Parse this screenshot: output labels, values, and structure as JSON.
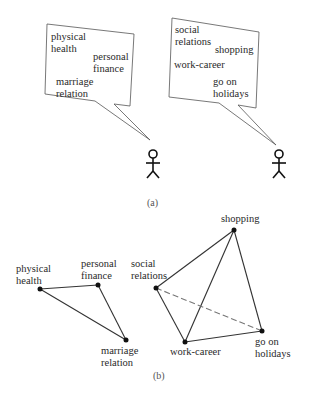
{
  "panel_a": {
    "caption": "(a)",
    "person_left": {
      "bubble_items": [
        {
          "line1": "physical",
          "line2": "health"
        },
        {
          "line1": "personal",
          "line2": "finance"
        },
        {
          "line1": "marriage",
          "line2": "relation"
        }
      ]
    },
    "person_right": {
      "bubble_items": [
        {
          "line1": "social",
          "line2": "relations"
        },
        {
          "line1": "shopping",
          "line2": ""
        },
        {
          "line1": "work-career",
          "line2": ""
        },
        {
          "line1": "go on",
          "line2": "holidays"
        }
      ]
    }
  },
  "panel_b": {
    "caption": "(b)",
    "graph_left": {
      "nodes": [
        {
          "id": "physical-health",
          "line1": "physical",
          "line2": "health"
        },
        {
          "id": "personal-finance",
          "line1": "personal",
          "line2": "finance"
        },
        {
          "id": "marriage-relation",
          "line1": "marriage",
          "line2": "relation"
        }
      ],
      "edges": [
        {
          "from": "physical-health",
          "to": "personal-finance",
          "style": "solid"
        },
        {
          "from": "personal-finance",
          "to": "marriage-relation",
          "style": "solid"
        },
        {
          "from": "physical-health",
          "to": "marriage-relation",
          "style": "solid"
        }
      ]
    },
    "graph_right": {
      "nodes": [
        {
          "id": "social-relations",
          "line1": "social",
          "line2": "relations"
        },
        {
          "id": "shopping",
          "line1": "shopping",
          "line2": ""
        },
        {
          "id": "work-career",
          "line1": "work-career",
          "line2": ""
        },
        {
          "id": "go-on-holidays",
          "line1": "go on",
          "line2": "holidays"
        }
      ],
      "edges": [
        {
          "from": "social-relations",
          "to": "shopping",
          "style": "solid"
        },
        {
          "from": "social-relations",
          "to": "work-career",
          "style": "solid"
        },
        {
          "from": "shopping",
          "to": "work-career",
          "style": "solid"
        },
        {
          "from": "shopping",
          "to": "go-on-holidays",
          "style": "solid"
        },
        {
          "from": "work-career",
          "to": "go-on-holidays",
          "style": "solid"
        },
        {
          "from": "social-relations",
          "to": "go-on-holidays",
          "style": "dashed"
        }
      ]
    }
  },
  "colors": {
    "line": "#333333",
    "bubble_stroke": "#555555",
    "text": "#2a2a2a",
    "background": "#ffffff"
  }
}
